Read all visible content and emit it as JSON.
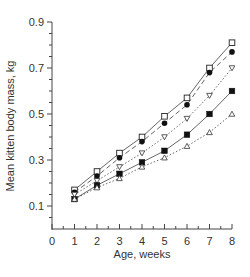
{
  "chart_data": {
    "type": "line",
    "title": "",
    "xlabel": "Age, weeks",
    "ylabel": "Mean kitten body mass, kg",
    "xlim": [
      0,
      8
    ],
    "ylim": [
      0,
      0.9
    ],
    "x_ticks": [
      0,
      1,
      2,
      3,
      4,
      5,
      6,
      7,
      8
    ],
    "y_ticks": [
      0.1,
      0.3,
      0.5,
      0.7,
      0.9
    ],
    "grid": false,
    "legend": "none",
    "x": [
      1,
      2,
      3,
      4,
      5,
      6,
      7,
      8
    ],
    "series": [
      {
        "name": "open-square",
        "marker": "square-open",
        "line": "solid",
        "values": [
          0.17,
          0.25,
          0.33,
          0.4,
          0.49,
          0.57,
          0.7,
          0.81
        ]
      },
      {
        "name": "filled-circle",
        "marker": "circle-filled",
        "line": "dashed",
        "values": [
          0.16,
          0.23,
          0.31,
          0.38,
          0.46,
          0.54,
          0.68,
          0.77
        ]
      },
      {
        "name": "inverted-triangle",
        "marker": "triangle-down-open",
        "line": "dotted",
        "values": [
          0.15,
          0.21,
          0.27,
          0.33,
          0.4,
          0.48,
          0.58,
          0.7
        ]
      },
      {
        "name": "filled-square",
        "marker": "square-filled",
        "line": "solid",
        "values": [
          0.13,
          0.19,
          0.24,
          0.29,
          0.34,
          0.41,
          0.5,
          0.6
        ]
      },
      {
        "name": "open-triangle",
        "marker": "triangle-up-open",
        "line": "dotted",
        "values": [
          0.13,
          0.18,
          0.22,
          0.27,
          0.31,
          0.36,
          0.42,
          0.5
        ]
      }
    ]
  }
}
